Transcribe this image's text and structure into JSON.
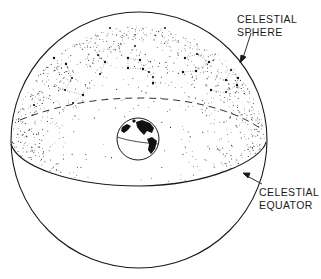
{
  "diagram": {
    "labels": {
      "celestial_sphere": {
        "line1": "CELESTIAL",
        "line2": "SPHERE"
      },
      "celestial_equator": {
        "line1": "CELESTIAL",
        "line2": "EQUATOR"
      }
    },
    "colors": {
      "ink": "#1a1a1a",
      "background": "#ffffff",
      "stipple": "#2a2a2a"
    },
    "elements": [
      "celestial-sphere-outline",
      "celestial-equator-front",
      "celestial-equator-back-dashed",
      "stippled-northern-hemisphere",
      "constellation-star-patterns",
      "earth-globe",
      "label-arrows"
    ]
  }
}
